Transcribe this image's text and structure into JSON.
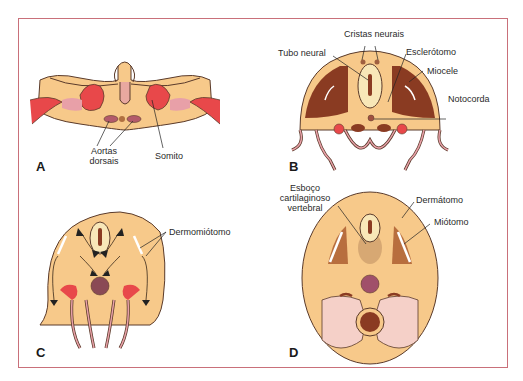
{
  "figure": {
    "title": "",
    "frame_color": "#c9707a",
    "colors": {
      "mesenchyme": "#f7c98a",
      "ectoderm_line": "#5a3a2a",
      "neural_tube": "#f8e7b8",
      "somite_red": "#e8484a",
      "pink": "#e8a0a8",
      "sclerotome_dark": "#8a3b22",
      "notochord": "#a05040",
      "aorta": "#b35a6a"
    },
    "panels": [
      {
        "letter": "A",
        "labels": {
          "aortas_line1": "Aortas",
          "aortas_line2": "dorsais",
          "somito": "Somito"
        }
      },
      {
        "letter": "B",
        "labels": {
          "cristas_neurais": "Cristas neurais",
          "tubo_neural": "Tubo neural",
          "esclerotomo": "Esclerótomo",
          "miocele": "Miocele",
          "notocorda": "Notocorda"
        }
      },
      {
        "letter": "C",
        "labels": {
          "dermomiotomo": "Dermomiótomo"
        }
      },
      {
        "letter": "D",
        "labels": {
          "esboco_line1": "Esboço",
          "esboco_line2": "cartilaginoso",
          "esboco_line3": "vertebral",
          "dermatomo": "Dermátomo",
          "miotomo": "Miótomo"
        }
      }
    ]
  }
}
